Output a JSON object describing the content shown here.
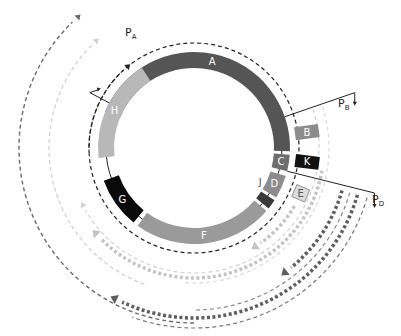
{
  "diagram": {
    "center": [
      194,
      148
    ],
    "ring": {
      "r_inner": 80,
      "r_outer": 96
    },
    "segments": [
      {
        "id": "A",
        "label": "A",
        "start": -68,
        "end": 92,
        "color": "#555555"
      },
      {
        "id": "C",
        "label": "C",
        "start": 94,
        "end": 104,
        "color": "#6e6e6e"
      },
      {
        "id": "D",
        "label": "D",
        "start": 107,
        "end": 121,
        "color": "#8c8c8c"
      },
      {
        "id": "J",
        "label": "J",
        "start": 123,
        "end": 129,
        "color": "#3a3a3a"
      },
      {
        "id": "F",
        "label": "F",
        "start": 131,
        "end": 216,
        "color": "#9a9a9a"
      },
      {
        "id": "G",
        "label": "G",
        "start": 219,
        "end": 250,
        "color": "#0a0a0a"
      },
      {
        "id": "H",
        "label": "H",
        "start": 264,
        "end": 327,
        "color": "#b8b8b8"
      }
    ],
    "outer_boxes": [
      {
        "id": "B",
        "label": "B",
        "angle": 82,
        "r": 114,
        "w": 13,
        "h": 24,
        "color": "#8c8c8c",
        "text_color": "#ffffff"
      },
      {
        "id": "K",
        "label": "K",
        "angle": 97,
        "r": 114,
        "w": 13,
        "h": 24,
        "color": "#111111",
        "text_color": "#ffffff"
      },
      {
        "id": "E",
        "label": "E",
        "angle": 113,
        "r": 116,
        "w": 13,
        "h": 14,
        "color": "#dcdcdc",
        "text_color": "#555555"
      }
    ],
    "promoters": [
      {
        "id": "PA",
        "main": "P",
        "sub": "A",
        "angle": -62,
        "r_from": 96,
        "r_to": 118,
        "tip_dx": 9,
        "label_xy": [
          125,
          36
        ]
      },
      {
        "id": "PB",
        "main": "P",
        "sub": "B",
        "angle": 71,
        "r_from": 96,
        "r_to": 170,
        "tip_dy": 10,
        "label_xy": [
          338,
          107
        ]
      },
      {
        "id": "PD",
        "main": "P",
        "sub": "D",
        "angle": 104,
        "r_from": 96,
        "r_to": 186,
        "tip_dy": 12,
        "label_xy": [
          372,
          203
        ]
      }
    ],
    "transcripts": [
      {
        "id": "inner-dashed-circle",
        "r": 105,
        "start": -90,
        "end": 267,
        "color": "#222222",
        "width": 1.2,
        "dash": "4 3",
        "arrow": "none"
      },
      {
        "id": "inner-dashed-arrow",
        "r": 105,
        "start": 267,
        "end": 318,
        "color": "#222222",
        "width": 1.2,
        "dash": "4 3",
        "arrow": "end"
      },
      {
        "id": "left-light-transcript",
        "r": 145,
        "start": 200,
        "end": 315,
        "color": "#cfcfcf",
        "width": 1.2,
        "dash": "4 3",
        "arrow": "end"
      },
      {
        "id": "left-dark-transcript",
        "r": 175,
        "start": 180,
        "end": 316,
        "color": "#6a6a6a",
        "width": 1.4,
        "dash": "4 3",
        "arrow": "end"
      },
      {
        "id": "PB-light-thin-1",
        "r": 125,
        "start": 72,
        "end": 240,
        "color": "#d2d2d2",
        "width": 1.2,
        "dash": "4 3",
        "arrow": "end"
      },
      {
        "id": "PB-light-thin-2",
        "r": 135,
        "start": 72,
        "end": 185,
        "color": "#dadada",
        "width": 1.2,
        "dash": "4 3",
        "arrow": "none"
      },
      {
        "id": "E-light-thick",
        "r": 116,
        "start": 120,
        "end": 145,
        "color": "#c4c4c4",
        "width": 3.5,
        "dash": "3 2.5",
        "arrow": "end"
      },
      {
        "id": "PB-light-thick",
        "r": 130,
        "start": 100,
        "end": 226,
        "color": "#c4c4c4",
        "width": 3.5,
        "dash": "3 2.5",
        "arrow": "end"
      },
      {
        "id": "PD-dark-thick-1",
        "r": 154,
        "start": 106,
        "end": 141,
        "color": "#5e5e5e",
        "width": 3.5,
        "dash": "3 2.5",
        "arrow": "end"
      },
      {
        "id": "PD-dark-thick-2",
        "r": 170,
        "start": 106,
        "end": 205,
        "color": "#5e5e5e",
        "width": 3.5,
        "dash": "3 2.5",
        "arrow": "end"
      },
      {
        "id": "PD-dark-thin",
        "r": 180,
        "start": 106,
        "end": 200,
        "color": "#777777",
        "width": 1.2,
        "dash": "4 3",
        "arrow": "none"
      },
      {
        "id": "PD-dark-thin-2",
        "r": 162,
        "start": 106,
        "end": 180,
        "color": "#888888",
        "width": 1.2,
        "dash": "4 3",
        "arrow": "none"
      }
    ],
    "j_label": {
      "text": "J",
      "xy": [
        259,
        185
      ]
    }
  }
}
